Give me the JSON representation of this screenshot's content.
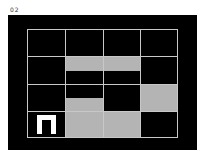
{
  "label": "02",
  "colors": {
    "background": "#ffffff",
    "panel": "#000000",
    "grid_line": "#c8c8c8",
    "fill": "#b4b4b4",
    "glyph": "#ffffff"
  },
  "grid": {
    "rows": 4,
    "cols": 4,
    "cells": [
      {
        "row": 1,
        "col": 1,
        "fill": "none"
      },
      {
        "row": 1,
        "col": 2,
        "fill": "none"
      },
      {
        "row": 1,
        "col": 3,
        "fill": "none"
      },
      {
        "row": 1,
        "col": 4,
        "fill": "none"
      },
      {
        "row": 2,
        "col": 1,
        "fill": "none"
      },
      {
        "row": 2,
        "col": 2,
        "fill": "top-half"
      },
      {
        "row": 2,
        "col": 3,
        "fill": "top-half"
      },
      {
        "row": 2,
        "col": 4,
        "fill": "none"
      },
      {
        "row": 3,
        "col": 1,
        "fill": "none"
      },
      {
        "row": 3,
        "col": 2,
        "fill": "bottom-half"
      },
      {
        "row": 3,
        "col": 3,
        "fill": "none"
      },
      {
        "row": 3,
        "col": 4,
        "fill": "full"
      },
      {
        "row": 4,
        "col": 1,
        "fill": "none",
        "glyph": "pi-shape"
      },
      {
        "row": 4,
        "col": 2,
        "fill": "full"
      },
      {
        "row": 4,
        "col": 3,
        "fill": "full"
      },
      {
        "row": 4,
        "col": 4,
        "fill": "none"
      }
    ]
  }
}
